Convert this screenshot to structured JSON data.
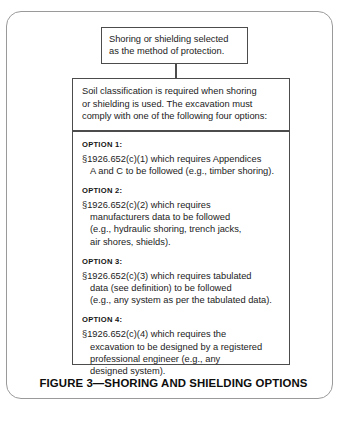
{
  "figure": {
    "caption": "FIGURE 3—SHORING AND SHIELDING OPTIONS",
    "top_box": {
      "lines": [
        "Shoring or shielding selected",
        "as the method of protection."
      ]
    },
    "main_box": {
      "intro_lines": [
        "Soil classification is required when shoring",
        "or shielding is used. The excavation must",
        "comply with one of the following four options:"
      ],
      "options": [
        {
          "label": "OPTION 1:",
          "lines": [
            {
              "text": "§1926.652(c)(1) which requires Appendices",
              "indent": false
            },
            {
              "text": "A and C to be followed (e.g., timber shoring).",
              "indent": true
            }
          ]
        },
        {
          "label": "OPTION 2:",
          "lines": [
            {
              "text": "§1926.652(c)(2) which requires",
              "indent": false
            },
            {
              "text": "manufacturers data to be followed",
              "indent": true
            },
            {
              "text": "(e.g., hydraulic shoring, trench jacks,",
              "indent": true
            },
            {
              "text": "air shores, shields).",
              "indent": true
            }
          ]
        },
        {
          "label": "OPTION 3:",
          "lines": [
            {
              "text": "§1926.652(c)(3) which requires tabulated",
              "indent": false
            },
            {
              "text": "data (see definition) to be followed",
              "indent": true
            },
            {
              "text": "(e.g., any system as per the tabulated data).",
              "indent": true
            }
          ]
        },
        {
          "label": "OPTION 4:",
          "lines": [
            {
              "text": "§1926.652(c)(4) which requires the",
              "indent": false
            },
            {
              "text": "excavation to be designed by a registered",
              "indent": true
            },
            {
              "text": "professional engineer (e.g., any",
              "indent": true
            },
            {
              "text": "designed system).",
              "indent": true
            }
          ]
        }
      ]
    }
  },
  "colors": {
    "border_outer": "#9a9a9a",
    "border_box": "#4c4c4c",
    "text": "#1b1b1b",
    "background": "#ffffff"
  }
}
